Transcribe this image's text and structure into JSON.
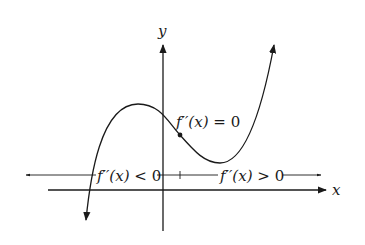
{
  "figure": {
    "axes": {
      "x_label": "x",
      "y_label": "y",
      "color": "#1a1a1a"
    },
    "curve": {
      "description": "cubic with local max left of y-axis, inflection point right of y-axis, local min further right",
      "color": "#1a1a1a"
    },
    "inflection_label": {
      "func": "f′′(x)",
      "rest": " = 0"
    },
    "number_line": {
      "left_label_func": "f′′(x)",
      "left_label_rest": " < 0",
      "right_label_func": "f′′(x)",
      "right_label_rest": " > 0"
    }
  }
}
